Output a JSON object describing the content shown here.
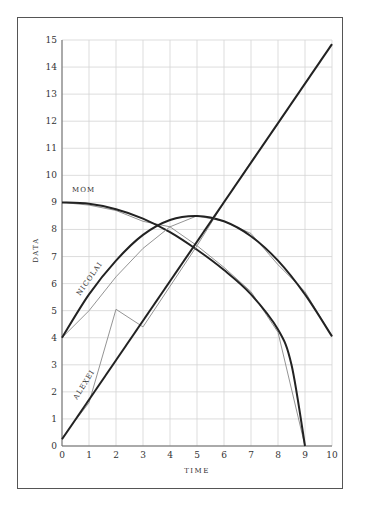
{
  "chart_data": {
    "type": "line",
    "title": "",
    "xlabel": "TIME",
    "ylabel": "DATA",
    "xlim": [
      0,
      10
    ],
    "ylim": [
      0,
      15
    ],
    "x_ticks": [
      "0",
      "1",
      "2",
      "3",
      "4",
      "5",
      "6",
      "7",
      "8",
      "9",
      "10"
    ],
    "y_ticks": [
      "0",
      "1",
      "2",
      "3",
      "4",
      "5",
      "6",
      "7",
      "8",
      "9",
      "10",
      "11",
      "12",
      "13",
      "14",
      "15"
    ],
    "grid": true,
    "legend": "inline labels",
    "series": [
      {
        "name": "MOM",
        "raw": {
          "x": [
            0,
            1,
            2,
            3,
            4,
            5,
            6,
            7,
            8,
            9
          ],
          "y": [
            9,
            8.9,
            8.7,
            8.3,
            8.1,
            7.4,
            6.6,
            5.7,
            4.2,
            0
          ]
        },
        "fit": {
          "x": [
            0,
            1,
            2,
            3,
            4,
            5,
            6,
            7,
            8,
            8.5,
            9
          ],
          "y": [
            9,
            8.95,
            8.75,
            8.4,
            7.9,
            7.25,
            6.5,
            5.6,
            4.3,
            3.0,
            0
          ]
        }
      },
      {
        "name": "NICOLAI",
        "raw": {
          "x": [
            0,
            1,
            2,
            3,
            4,
            5,
            6,
            7,
            8,
            9,
            10
          ],
          "y": [
            4,
            5,
            6.25,
            7.3,
            8.1,
            8.5,
            8.3,
            7.85,
            6.7,
            5.7,
            4.05
          ]
        },
        "fit": {
          "x": [
            0,
            1,
            2,
            3,
            4,
            5,
            6,
            7,
            8,
            9,
            10
          ],
          "y": [
            4,
            5.6,
            6.85,
            7.8,
            8.35,
            8.5,
            8.3,
            7.75,
            6.85,
            5.6,
            4.05
          ]
        }
      },
      {
        "name": "ALEXEI",
        "raw": {
          "x": [
            0,
            1,
            2,
            3,
            4,
            5,
            6,
            7,
            8,
            9,
            10
          ],
          "y": [
            0.3,
            1.6,
            5.05,
            4.4,
            5.9,
            7.4,
            9.0,
            10.5,
            11.9,
            13.4,
            14.85
          ]
        },
        "fit": {
          "x": [
            0,
            10
          ],
          "y": [
            0.25,
            14.85
          ]
        }
      }
    ]
  },
  "labels": {
    "mom": "MOM",
    "nicolai": "NICOLAI",
    "alexei": "ALEXEI",
    "x_title": "TIME",
    "y_title": "DATA"
  }
}
